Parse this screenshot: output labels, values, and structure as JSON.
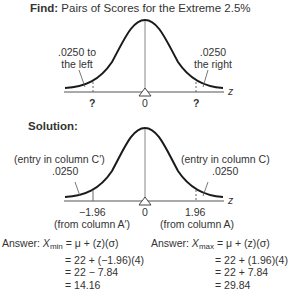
{
  "find": {
    "label": "Find:",
    "title": "Pairs of Scores for the Extreme 2.5%",
    "left_area_line1": ".0250 to",
    "left_area_line2": "the left",
    "right_area_line1": ".0250",
    "right_area_line2": "the right",
    "left_tick": "?",
    "center_tick": "0",
    "right_tick": "?",
    "axis_label": "z"
  },
  "solution": {
    "label": "Solution:",
    "left_note": "(entry in column C′)",
    "left_area": ".0250",
    "right_note": "(entry in column C)",
    "right_area": ".0250",
    "left_tick": "−1.96",
    "center_tick": "0",
    "right_tick": "1.96",
    "left_source": "(from column A′)",
    "right_source": "(from column A)",
    "axis_label": "z"
  },
  "answers": {
    "min": {
      "prefix": "Answer:",
      "var": "X",
      "sub": "min",
      "line1": "= μ + (z)(σ)",
      "line2": "= 22 + (−1.96)(4)",
      "line3": "= 22 − 7.84",
      "line4": "= 14.16"
    },
    "max": {
      "prefix": "Answer:",
      "var": "X",
      "sub": "max",
      "line1": "= μ + (z)(σ)",
      "line2": "= 22 + (1.96)(4)",
      "line3": "= 22 + 7.84",
      "line4": "= 29.84"
    }
  },
  "colors": {
    "curve": "#1a1a1a",
    "axis": "#555555",
    "text": "#333333"
  }
}
